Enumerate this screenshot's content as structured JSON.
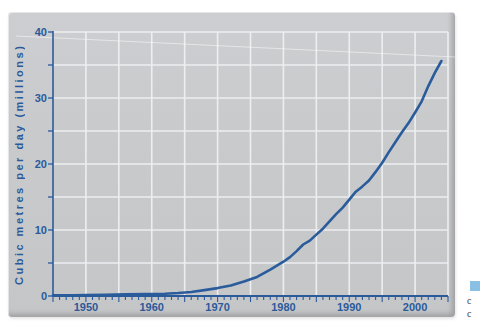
{
  "figure": {
    "panel_color": "#c9cacc",
    "grid_color": "#edeef0",
    "axis_color": "#2b5a9b",
    "label_color": "#2b5a9b",
    "curve_color": "#2a5c9c",
    "artifact_line_color": "rgba(255,255,255,0.5)"
  },
  "chart_data": {
    "type": "line",
    "title": "",
    "xlabel": "",
    "ylabel": "Cubic metres per day (millions)",
    "xlim": [
      1945,
      2005
    ],
    "ylim": [
      0,
      40
    ],
    "x_major_ticks": [
      1950,
      1960,
      1970,
      1980,
      1990,
      2000
    ],
    "x_minor_tick_interval": 1,
    "y_major_ticks": [
      0,
      10,
      20,
      30,
      40
    ],
    "y_minor_tick_interval": 5,
    "grid": true,
    "grid_interval_x_years": 5,
    "grid_interval_y_value": 5,
    "legend": "none",
    "series": [
      {
        "name": "cubic metres per day",
        "color": "#2a5c9c",
        "points": [
          [
            1945,
            0.1
          ],
          [
            1948,
            0.12
          ],
          [
            1950,
            0.15
          ],
          [
            1953,
            0.2
          ],
          [
            1956,
            0.25
          ],
          [
            1959,
            0.3
          ],
          [
            1962,
            0.35
          ],
          [
            1964,
            0.45
          ],
          [
            1966,
            0.6
          ],
          [
            1968,
            0.9
          ],
          [
            1970,
            1.2
          ],
          [
            1972,
            1.6
          ],
          [
            1974,
            2.2
          ],
          [
            1976,
            2.9
          ],
          [
            1978,
            4.0
          ],
          [
            1980,
            5.2
          ],
          [
            1981,
            5.9
          ],
          [
            1982,
            6.8
          ],
          [
            1983,
            7.8
          ],
          [
            1984,
            8.4
          ],
          [
            1985,
            9.3
          ],
          [
            1986,
            10.2
          ],
          [
            1987,
            11.3
          ],
          [
            1988,
            12.4
          ],
          [
            1989,
            13.4
          ],
          [
            1990,
            14.6
          ],
          [
            1991,
            15.8
          ],
          [
            1992,
            16.6
          ],
          [
            1993,
            17.5
          ],
          [
            1994,
            18.8
          ],
          [
            1995,
            20.2
          ],
          [
            1996,
            21.8
          ],
          [
            1997,
            23.3
          ],
          [
            1998,
            24.8
          ],
          [
            1999,
            26.2
          ],
          [
            2000,
            27.8
          ],
          [
            2001,
            29.5
          ],
          [
            2002,
            31.8
          ],
          [
            2003,
            33.8
          ],
          [
            2004,
            35.6
          ]
        ]
      }
    ]
  },
  "caption_fragment": {
    "marker_color": "#8ac0e4",
    "lines": [
      "c",
      "c"
    ]
  }
}
